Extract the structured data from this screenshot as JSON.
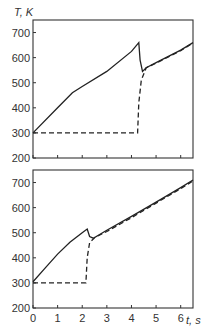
{
  "chart_data": [
    {
      "type": "line",
      "panel": "top",
      "ylabel": "T, K",
      "xlabel": "t, s",
      "xlim": [
        0,
        6.5
      ],
      "ylim": [
        200,
        750
      ],
      "yticks": [
        200,
        300,
        400,
        500,
        600,
        700
      ],
      "xticks": [
        0,
        1,
        2,
        3,
        4,
        5,
        6
      ],
      "xtick_labels_shown": false,
      "grid": false,
      "series": [
        {
          "name": "solid",
          "style": "solid",
          "x": [
            0,
            1.0,
            1.6,
            2.0,
            3.0,
            4.0,
            4.3,
            4.35,
            4.45,
            4.6,
            5.0,
            5.5,
            6.0,
            6.5
          ],
          "y": [
            300,
            400,
            460,
            485,
            545,
            625,
            660,
            590,
            545,
            560,
            580,
            605,
            630,
            660
          ]
        },
        {
          "name": "dashed",
          "style": "dashed",
          "x": [
            0,
            4.25,
            4.3,
            4.4,
            4.6,
            5.0,
            5.5,
            6.0,
            6.5
          ],
          "y": [
            300,
            300,
            420,
            510,
            560,
            578,
            603,
            628,
            658
          ]
        }
      ]
    },
    {
      "type": "line",
      "panel": "bottom",
      "ylabel": "",
      "xlabel": "t, s",
      "xlim": [
        0,
        6.5
      ],
      "ylim": [
        200,
        750
      ],
      "yticks": [
        200,
        300,
        400,
        500,
        600,
        700
      ],
      "xticks": [
        0,
        1,
        2,
        3,
        4,
        5,
        6
      ],
      "grid": false,
      "series": [
        {
          "name": "solid",
          "style": "solid",
          "x": [
            0,
            0.5,
            1.0,
            1.5,
            2.0,
            2.2,
            2.3,
            2.45,
            3.0,
            4.0,
            5.0,
            6.0,
            6.5
          ],
          "y": [
            305,
            360,
            415,
            462,
            500,
            515,
            485,
            478,
            510,
            565,
            622,
            680,
            710
          ]
        },
        {
          "name": "dashed",
          "style": "dashed",
          "x": [
            0,
            2.15,
            2.2,
            2.3,
            2.5,
            3.0,
            4.0,
            5.0,
            6.0,
            6.5
          ],
          "y": [
            300,
            300,
            400,
            460,
            480,
            505,
            560,
            618,
            676,
            706
          ]
        }
      ]
    }
  ],
  "labels": {
    "y_axis_title": "T, K",
    "x_axis_title": "t, s",
    "y_ticks": [
      "200",
      "300",
      "400",
      "500",
      "600",
      "700"
    ],
    "x_ticks": [
      "0",
      "1",
      "2",
      "3",
      "4",
      "5",
      "6"
    ]
  }
}
